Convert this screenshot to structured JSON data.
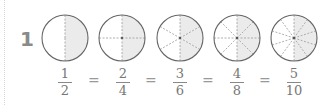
{
  "problem": {
    "number": "1",
    "circles": [
      {
        "parts": 2,
        "shaded": 1
      },
      {
        "parts": 4,
        "shaded": 2
      },
      {
        "parts": 6,
        "shaded": 3
      },
      {
        "parts": 8,
        "shaded": 4
      },
      {
        "parts": 10,
        "shaded": 5
      }
    ],
    "fractions": [
      {
        "num": "1",
        "den": "2"
      },
      {
        "num": "2",
        "den": "4"
      },
      {
        "num": "3",
        "den": "6"
      },
      {
        "num": "4",
        "den": "8"
      },
      {
        "num": "5",
        "den": "10"
      }
    ],
    "equals": [
      "=",
      "=",
      "=",
      "="
    ]
  },
  "colors": {
    "shade": "#ebebeb",
    "outline": "#666666",
    "divider": "#999999"
  }
}
